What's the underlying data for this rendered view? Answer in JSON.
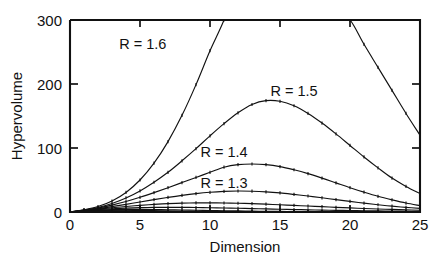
{
  "chart_data": {
    "type": "line",
    "title": "",
    "xlabel": "Dimension",
    "ylabel": "Hypervolume",
    "xlim": [
      0,
      25
    ],
    "ylim": [
      0,
      300
    ],
    "xticks": [
      0,
      5,
      10,
      15,
      20,
      25
    ],
    "yticks": [
      0,
      100,
      200,
      300
    ],
    "xticklabels": [
      "0",
      "5",
      "10",
      "15",
      "20",
      "25"
    ],
    "yticklabels": [
      "0",
      "100",
      "200",
      "300"
    ],
    "grid": false,
    "legend": "inline-annotations",
    "annotations": [
      {
        "text": "R = 1.6",
        "x": 5.2,
        "y": 255
      },
      {
        "text": "R = 1.5",
        "x": 16.0,
        "y": 182
      },
      {
        "text": "R = 1.4",
        "x": 11.0,
        "y": 86
      },
      {
        "text": "R = 1.3",
        "x": 11.0,
        "y": 38
      }
    ],
    "series": [
      {
        "name": "R = 1.6",
        "label": "R = 1.6",
        "x": [
          1,
          2,
          3,
          4,
          5,
          6,
          7,
          8,
          9,
          10,
          11,
          12,
          13,
          14,
          15,
          16,
          17,
          18,
          19,
          20,
          21,
          22,
          23,
          24,
          25
        ],
        "y": [
          3.4,
          8.5,
          17.2,
          30.6,
          50.0,
          76.3,
          110.0,
          151.0,
          199.0,
          252.0,
          300.0,
          360.0,
          405.0,
          436.0,
          448.0,
          440.0,
          412.0,
          368.0,
          315.0,
          300.0,
          262.0,
          226.0,
          190.0,
          154.0,
          120.0
        ]
      },
      {
        "name": "R = 1.5",
        "label": "R = 1.5",
        "x": [
          1,
          2,
          3,
          4,
          5,
          6,
          7,
          8,
          9,
          10,
          11,
          12,
          13,
          14,
          15,
          16,
          17,
          18,
          19,
          20,
          21,
          22,
          23,
          24,
          25
        ],
        "y": [
          3.0,
          7.1,
          13.4,
          22.0,
          33.0,
          46.5,
          62.0,
          80.0,
          99.0,
          119.0,
          138.0,
          155.0,
          168.0,
          174.0,
          173.0,
          166.0,
          154.0,
          139.0,
          122.0,
          104.0,
          86.0,
          69.0,
          53.0,
          40.0,
          29.0
        ]
      },
      {
        "name": "R = 1.4",
        "label": "R = 1.4",
        "x": [
          1,
          2,
          3,
          4,
          5,
          6,
          7,
          8,
          9,
          10,
          11,
          12,
          13,
          14,
          15,
          16,
          17,
          18,
          19,
          20,
          21,
          22,
          23,
          24,
          25
        ],
        "y": [
          2.8,
          6.2,
          10.8,
          16.4,
          23.0,
          30.3,
          38.0,
          46.0,
          54.0,
          62.0,
          70.0,
          74.0,
          75.0,
          74.0,
          71.0,
          66.0,
          60.0,
          53.0,
          45.5,
          38.0,
          31.0,
          24.5,
          19.0,
          14.0,
          10.0
        ]
      },
      {
        "name": "R = 1.3",
        "label": "R = 1.3",
        "x": [
          1,
          2,
          3,
          4,
          5,
          6,
          7,
          8,
          9,
          10,
          11,
          12,
          13,
          14,
          15,
          16,
          17,
          18,
          19,
          20,
          21,
          22,
          23,
          24,
          25
        ],
        "y": [
          2.6,
          5.3,
          8.5,
          12.0,
          15.6,
          19.3,
          22.8,
          26.0,
          28.7,
          30.8,
          32.2,
          32.8,
          32.5,
          31.5,
          29.8,
          27.5,
          25.0,
          22.2,
          19.3,
          16.5,
          13.8,
          11.3,
          9.1,
          7.2,
          5.6
        ]
      },
      {
        "name": "R = 1.2",
        "label": "",
        "x": [
          1,
          2,
          3,
          4,
          5,
          6,
          7,
          8,
          9,
          10,
          11,
          12,
          13,
          14,
          15,
          16,
          17,
          18,
          19,
          20,
          21,
          22,
          23,
          24,
          25
        ],
        "y": [
          2.4,
          4.5,
          6.6,
          8.6,
          10.4,
          11.9,
          13.0,
          13.8,
          14.2,
          14.3,
          14.1,
          13.7,
          13.0,
          12.2,
          11.3,
          10.3,
          9.3,
          8.3,
          7.3,
          6.4,
          5.5,
          4.7,
          4.0,
          3.4,
          2.8
        ]
      },
      {
        "name": "R = 1.1",
        "label": "",
        "x": [
          1,
          2,
          3,
          4,
          5,
          6,
          7,
          8,
          9,
          10,
          11,
          12,
          13,
          14,
          15,
          16,
          17,
          18,
          19,
          20,
          21,
          22,
          23,
          24,
          25
        ],
        "y": [
          2.2,
          3.8,
          5.1,
          6.1,
          6.8,
          7.2,
          7.3,
          7.2,
          7.0,
          6.7,
          6.3,
          5.8,
          5.3,
          4.8,
          4.3,
          3.8,
          3.4,
          3.0,
          2.6,
          2.3,
          2.0,
          1.7,
          1.4,
          1.2,
          1.0
        ]
      },
      {
        "name": "R = 1.0",
        "label": "",
        "x": [
          1,
          2,
          3,
          4,
          5,
          6,
          7,
          8,
          9,
          10,
          11,
          12,
          13,
          14,
          15,
          16,
          17,
          18,
          19,
          20,
          21,
          22,
          23,
          24,
          25
        ],
        "y": [
          2.0,
          3.1,
          3.8,
          4.1,
          4.1,
          3.9,
          3.6,
          3.2,
          2.8,
          2.4,
          2.0,
          1.7,
          1.4,
          1.1,
          0.9,
          0.7,
          0.6,
          0.5,
          0.4,
          0.3,
          0.25,
          0.2,
          0.16,
          0.13,
          0.1
        ]
      },
      {
        "name": "R = 0.9",
        "label": "",
        "x": [
          1,
          2,
          3,
          4,
          5,
          6,
          7,
          8,
          9,
          10,
          11,
          12,
          13,
          14,
          15,
          16,
          17,
          18,
          19,
          20,
          21,
          22,
          23,
          24,
          25
        ],
        "y": [
          1.8,
          2.5,
          2.8,
          2.7,
          2.4,
          2.1,
          1.7,
          1.4,
          1.1,
          0.85,
          0.65,
          0.5,
          0.37,
          0.28,
          0.2,
          0.15,
          0.11,
          0.08,
          0.06,
          0.045,
          0.03,
          0.025,
          0.018,
          0.013,
          0.01
        ]
      },
      {
        "name": "R = 0.8",
        "label": "",
        "x": [
          1,
          2,
          3,
          4,
          5,
          6,
          7,
          8,
          9,
          10,
          11,
          12,
          13,
          14,
          15,
          16,
          17,
          18,
          19,
          20,
          21,
          22,
          23,
          24,
          25
        ],
        "y": [
          1.6,
          2.0,
          2.0,
          1.7,
          1.4,
          1.1,
          0.8,
          0.57,
          0.4,
          0.27,
          0.18,
          0.12,
          0.08,
          0.05,
          0.03,
          0.02,
          0.014,
          0.009,
          0.006,
          0.004,
          0.003,
          0.002,
          0.001,
          0.001,
          0.0
        ]
      },
      {
        "name": "R = 0.7",
        "label": "",
        "x": [
          1,
          2,
          3,
          4,
          5,
          6,
          7,
          8,
          9,
          10,
          11,
          12,
          13,
          14,
          15,
          16,
          17,
          18,
          19,
          20,
          21,
          22,
          23,
          24,
          25
        ],
        "y": [
          1.4,
          1.5,
          1.4,
          1.0,
          0.72,
          0.48,
          0.3,
          0.18,
          0.1,
          0.06,
          0.035,
          0.02,
          0.011,
          0.006,
          0.003,
          0.002,
          0.001,
          0.0,
          0.0,
          0.0,
          0.0,
          0.0,
          0.0,
          0.0,
          0.0
        ]
      }
    ]
  }
}
